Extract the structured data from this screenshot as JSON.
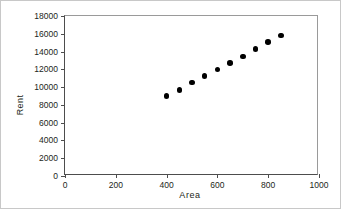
{
  "chart_data": {
    "type": "scatter",
    "title": "",
    "xlabel": "Area",
    "ylabel": "Rent",
    "xlim": [
      0,
      1000
    ],
    "ylim": [
      0,
      18000
    ],
    "xticks": [
      0,
      200,
      400,
      600,
      800,
      1000
    ],
    "yticks": [
      0,
      2000,
      4000,
      6000,
      8000,
      10000,
      12000,
      14000,
      16000,
      18000
    ],
    "xtick_labels": [
      "0",
      "200",
      "400",
      "600",
      "800",
      "1000"
    ],
    "ytick_labels": [
      "0",
      "2000",
      "4000",
      "6000",
      "8000",
      "10000",
      "12000",
      "14000",
      "16000",
      "18000"
    ],
    "grid": false,
    "legend": null,
    "marker": "filled-circle",
    "marker_color": "#000000",
    "x": [
      400,
      450,
      500,
      550,
      600,
      650,
      700,
      750,
      800,
      850
    ],
    "y": [
      9000,
      9700,
      10500,
      11250,
      12000,
      12700,
      13450,
      14300,
      15100,
      15800
    ],
    "points": [
      {
        "x": 400,
        "y": 9000
      },
      {
        "x": 450,
        "y": 9700
      },
      {
        "x": 500,
        "y": 10500
      },
      {
        "x": 550,
        "y": 11250
      },
      {
        "x": 600,
        "y": 12000
      },
      {
        "x": 650,
        "y": 12700
      },
      {
        "x": 700,
        "y": 13450
      },
      {
        "x": 750,
        "y": 14300
      },
      {
        "x": 800,
        "y": 15100
      },
      {
        "x": 850,
        "y": 15800
      }
    ]
  }
}
